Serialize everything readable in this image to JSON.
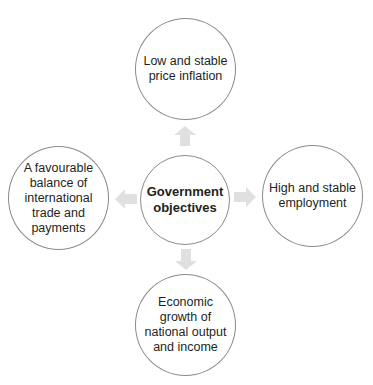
{
  "diagram": {
    "center": {
      "label": "Government\nobjectives"
    },
    "nodes": [
      {
        "id": "top",
        "label": "Low and stable\nprice inflation"
      },
      {
        "id": "right",
        "label": "High and stable\nemployment"
      },
      {
        "id": "bottom",
        "label": "Economic\ngrowth of\nnational output\nand income"
      },
      {
        "id": "left",
        "label": "A favourable\nbalance of\ninternational\ntrade and\npayments"
      }
    ],
    "colors": {
      "circle_border": "#8a8a8a",
      "arrow_fill": "#e0e0e0",
      "text": "#231f20"
    }
  }
}
